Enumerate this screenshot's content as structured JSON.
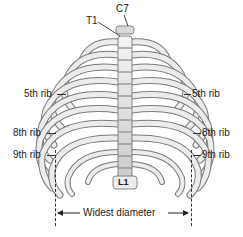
{
  "figure": {
    "type": "anatomical-diagram",
    "labels": {
      "c7": "C7",
      "t1": "T1",
      "l1": "L1",
      "rib5_left": "5th rib",
      "rib8_left": "8th rib",
      "rib9_left": "9th rib",
      "rib5_right": "5th rib",
      "rib8_right": "8th rib",
      "rib9_right": "9th rib",
      "diameter": "Widest diameter"
    },
    "colors": {
      "bone": "#e8e8e8",
      "bone_outline": "#6b6b6b",
      "shadow": "#9a9a9a",
      "text": "#222222"
    }
  }
}
